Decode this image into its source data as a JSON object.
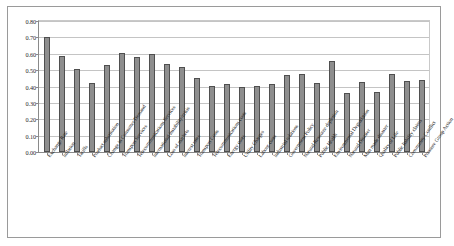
{
  "chart_data": {
    "type": "bar",
    "title": "",
    "subtitle": "",
    "xlabel": "",
    "ylabel": "",
    "ylim": [
      0.0,
      0.8
    ],
    "ytick_labels": [
      "0.80",
      "0.70",
      "0.60",
      "0.50",
      "0.40",
      "0.30",
      "0.20",
      "0.10",
      "0.00"
    ],
    "ytick_values": [
      0.8,
      0.7,
      0.6,
      0.5,
      0.4,
      0.3,
      0.2,
      0.1,
      0.0
    ],
    "grid": true,
    "legend": "none",
    "series_name": "",
    "bar_color": "#8e8e8e",
    "bar_border_color": "#4f4f4f",
    "categories": [
      "Exchange Rate",
      "Inflation",
      "Tariffs",
      "Product substitution",
      "Change in Consumer Demand",
      "Transport Services",
      "Telecommunications Services",
      "International instability/crisis",
      "Loss of markets",
      "Interest rates",
      "Transport Costs",
      "Telecommunications costs",
      "Energy costs",
      "Utility Charges",
      "Labour costs",
      "Industrial relations",
      "Government Policy",
      "Natural Resource depletion",
      "Public Health",
      "Environmental Degradation",
      "Natural Disaster",
      "Man made disaster",
      "Quality of Life",
      "Public liability claims",
      "Community Conflict",
      "Pressure Group Action"
    ],
    "values": [
      0.7,
      0.585,
      0.51,
      0.42,
      0.53,
      0.605,
      0.58,
      0.6,
      0.535,
      0.52,
      0.455,
      0.405,
      0.415,
      0.4,
      0.405,
      0.415,
      0.47,
      0.475,
      0.42,
      0.555,
      0.36,
      0.425,
      0.365,
      0.475,
      0.435,
      0.44
    ]
  },
  "axis": {
    "y_max_label": "0.80",
    "y_min_label": "0.00"
  }
}
